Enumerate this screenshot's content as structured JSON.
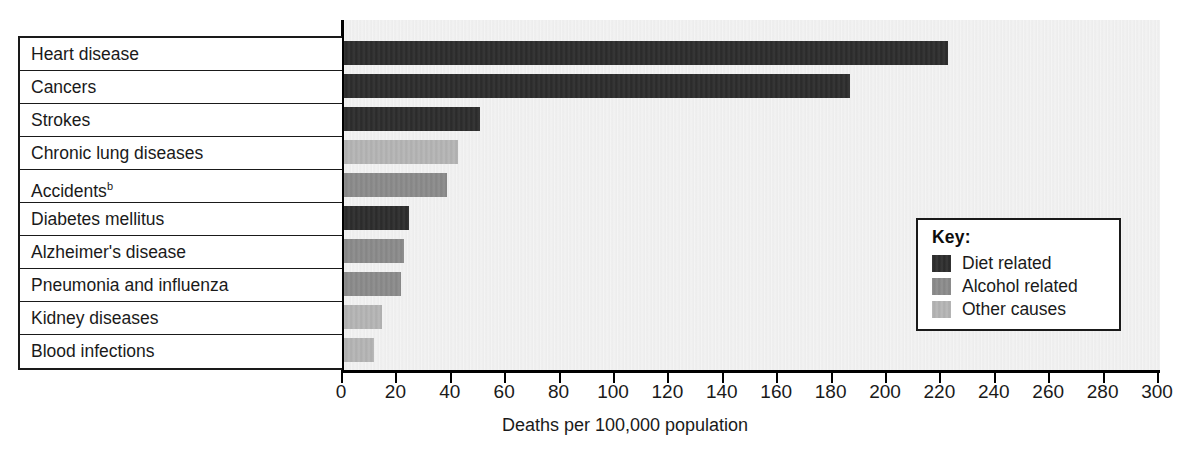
{
  "chart_data": {
    "type": "bar",
    "orientation": "horizontal",
    "title": "",
    "xlabel": "Deaths per 100,000 population",
    "ylabel": "",
    "xlim": [
      0,
      300
    ],
    "xticks": [
      0,
      20,
      40,
      60,
      80,
      100,
      120,
      140,
      160,
      180,
      200,
      220,
      240,
      260,
      280,
      300
    ],
    "xtick_labels": [
      "0",
      "20",
      "40",
      "60",
      "80",
      "100",
      "120",
      "140",
      "160",
      "180",
      "200",
      "220",
      "240",
      "260",
      "280",
      "300"
    ],
    "grid": false,
    "legend_position": "inside-right",
    "categories": [
      "Heart disease",
      "Cancers",
      "Strokes",
      "Chronic lung diseases",
      "Accidents",
      "Diabetes mellitus",
      "Alzheimer's disease",
      "Pneumonia and influenza",
      "Kidney diseases",
      "Blood infections"
    ],
    "category_footnotes": [
      "",
      "",
      "",
      "",
      "b",
      "",
      "",
      "",
      "",
      ""
    ],
    "values": [
      222,
      186,
      50,
      42,
      38,
      24,
      22,
      21,
      14,
      11
    ],
    "groups": [
      "diet",
      "diet",
      "diet",
      "other",
      "alcohol",
      "diet",
      "alcohol",
      "alcohol",
      "other",
      "other"
    ],
    "legend": {
      "title": "Key:",
      "entries": [
        {
          "key": "diet",
          "label": "Diet related",
          "color": "#2b2b2b"
        },
        {
          "key": "alcohol",
          "label": "Alcohol related",
          "color": "#8b8b8b"
        },
        {
          "key": "other",
          "label": "Other causes",
          "color": "#b6b6b6"
        }
      ]
    }
  },
  "colors": {
    "diet": "#2b2b2b",
    "alcohol": "#8b8b8b",
    "other": "#b6b6b6",
    "plot_background": "#ececec",
    "axis": "#000000",
    "text": "#1a1a1a"
  }
}
